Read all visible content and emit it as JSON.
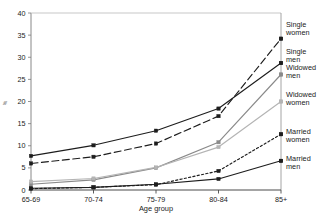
{
  "chart_data": {
    "type": "line",
    "title": "",
    "xlabel": "Age group",
    "ylabel": "%",
    "categories": [
      "65-69",
      "70-74",
      "75-79",
      "80-84",
      "85+"
    ],
    "ylim": [
      0,
      40
    ],
    "yticks": [
      0,
      5,
      10,
      15,
      20,
      25,
      30,
      35,
      40
    ],
    "grid": false,
    "legend_position": "right",
    "series": [
      {
        "name": "Single women",
        "values": [
          6.0,
          7.5,
          10.5,
          16.7,
          34.2
        ],
        "style": "dashed",
        "color": "#1d1d1d",
        "marker": "square"
      },
      {
        "name": "Single men",
        "values": [
          7.7,
          10.1,
          13.4,
          18.4,
          28.7
        ],
        "style": "solid",
        "color": "#1d1d1d",
        "marker": "square"
      },
      {
        "name": "Widowed men",
        "values": [
          1.3,
          2.3,
          5.0,
          10.8,
          26.1
        ],
        "style": "solid",
        "color": "#8a8a8a",
        "marker": "square"
      },
      {
        "name": "Widowed women",
        "values": [
          1.9,
          2.6,
          5.1,
          9.7,
          20.0
        ],
        "style": "solid",
        "color": "#b4b4b4",
        "marker": "square"
      },
      {
        "name": "Married women",
        "values": [
          0.3,
          0.6,
          1.2,
          4.3,
          12.6
        ],
        "style": "dotted",
        "color": "#1d1d1d",
        "marker": "square"
      },
      {
        "name": "Married men",
        "values": [
          0.4,
          0.6,
          1.3,
          2.5,
          6.6
        ],
        "style": "solid",
        "color": "#1d1d1d",
        "marker": "square"
      }
    ],
    "legend_entries": [
      {
        "label_line1": "Single",
        "label_line2": "women"
      },
      {
        "label_line1": "Single",
        "label_line2": "men"
      },
      {
        "label_line1": "Widowed",
        "label_line2": "men"
      },
      {
        "label_line1": "Widowed",
        "label_line2": "women"
      },
      {
        "label_line1": "Married",
        "label_line2": "women"
      },
      {
        "label_line1": "Married",
        "label_line2": "men"
      }
    ]
  }
}
